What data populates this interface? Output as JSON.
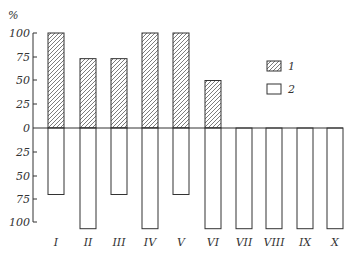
{
  "chart_data": {
    "type": "bar",
    "title": "",
    "xlabel": "",
    "ylabel": "%",
    "categories": [
      "I",
      "II",
      "III",
      "IV",
      "V",
      "VI",
      "VII",
      "VIII",
      "IX",
      "X"
    ],
    "series": [
      {
        "name": "1",
        "pattern": "hatched",
        "direction": "up",
        "values": [
          100,
          73,
          73,
          100,
          100,
          50,
          0,
          0,
          0,
          0
        ]
      },
      {
        "name": "2",
        "pattern": "empty",
        "direction": "down",
        "values": [
          70,
          106,
          70,
          106,
          70,
          106,
          106,
          106,
          106,
          106
        ]
      }
    ],
    "y_ticks_up": [
      "100",
      "75",
      "50",
      "25",
      "0"
    ],
    "y_ticks_down": [
      "25",
      "50",
      "75",
      "100"
    ],
    "ylim": [
      -100,
      100
    ],
    "grid": false,
    "legend": {
      "position": "upper-right",
      "entries": [
        "1",
        "2"
      ]
    },
    "colors": {
      "stroke": "#333333",
      "background": "#ffffff"
    }
  }
}
